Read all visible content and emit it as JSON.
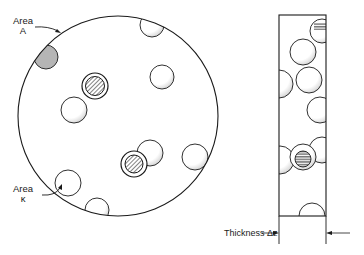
{
  "figure": {
    "labels": {
      "area_a_line1": "Area",
      "area_a_line2": "A",
      "area_k_line1": "Area",
      "area_k_line2": "κ",
      "thickness": "Thickness Δz"
    },
    "colors": {
      "ink": "#1a1a1a",
      "shade": "#9a9a9a",
      "background": "#ffffff"
    },
    "disc": {
      "cx": 118,
      "cy": 116,
      "r": 100
    },
    "slab": {
      "x": 279,
      "y": 15,
      "width": 47,
      "height": 201,
      "extension_bottom": 244,
      "arrow_y": 233
    }
  }
}
